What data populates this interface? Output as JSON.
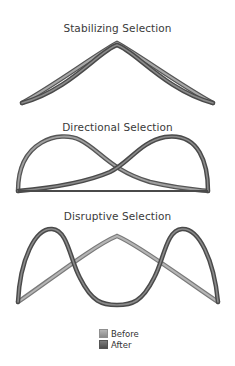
{
  "panels": [
    {
      "title": "Stabilizing Selection"
    },
    {
      "title": "Directional Selection"
    },
    {
      "title": "Disruptive Selection"
    }
  ],
  "legend": {
    "items": [
      {
        "label": "Before",
        "color": "#9e9e9e"
      },
      {
        "label": "After",
        "color": "#5e5e5e"
      }
    ]
  },
  "colors": {
    "before_stroke": "#9a9a9a",
    "after_stroke": "#555555",
    "title_text": "#3a3a3a"
  }
}
